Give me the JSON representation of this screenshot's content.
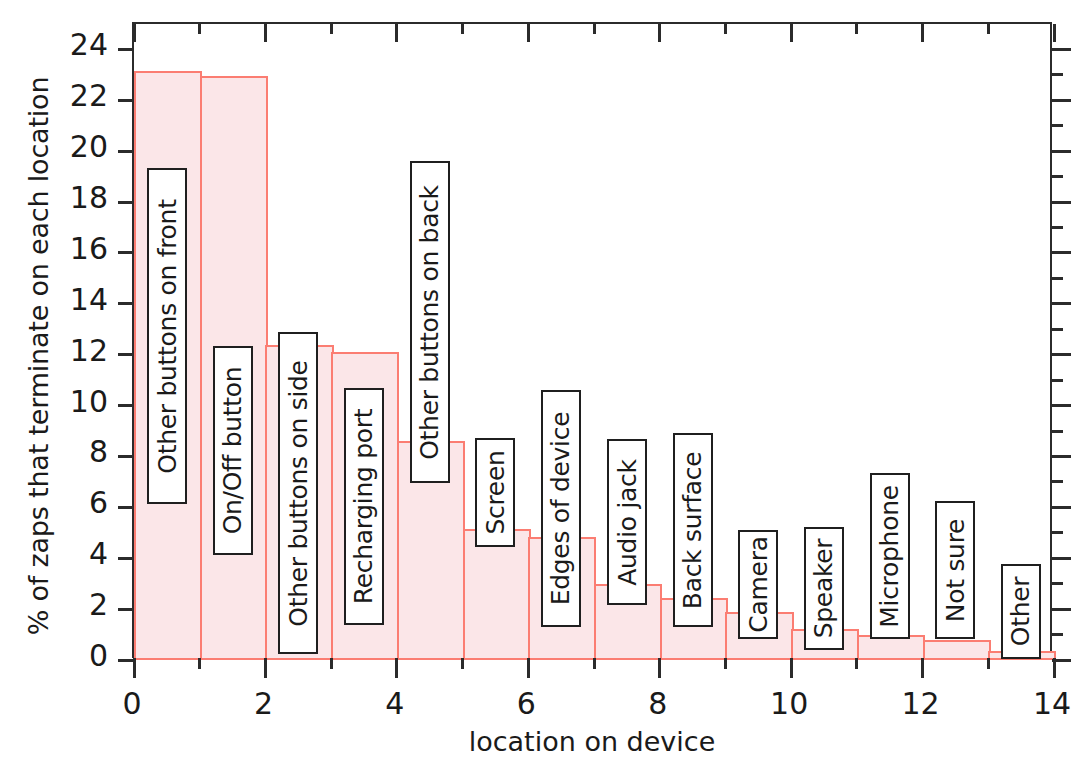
{
  "chart_data": {
    "type": "bar",
    "title": "",
    "xlabel": "location on device",
    "ylabel": "% of zaps that terminate on each location",
    "xlim": [
      0,
      14
    ],
    "ylim": [
      0,
      25
    ],
    "grid": false,
    "legend": "none",
    "x_tick_labels": [
      "0",
      "2",
      "4",
      "6",
      "8",
      "10",
      "12",
      "14"
    ],
    "x_tick_values": [
      0,
      2,
      4,
      6,
      8,
      10,
      12,
      14
    ],
    "y_tick_labels": [
      "0",
      "2",
      "4",
      "6",
      "8",
      "10",
      "12",
      "14",
      "16",
      "18",
      "20",
      "22",
      "24"
    ],
    "y_tick_values": [
      0,
      2,
      4,
      6,
      8,
      10,
      12,
      14,
      16,
      18,
      20,
      22,
      24
    ],
    "categories": [
      "Other buttons on front",
      "On/Off button",
      "Other buttons on side",
      "Recharging port",
      "Other buttons on back",
      "Screen",
      "Edges of device",
      "Audio jack",
      "Back surface",
      "Camera",
      "Speaker",
      "Microphone",
      "Not sure",
      "Other"
    ],
    "values": [
      23.15,
      22.95,
      12.4,
      12.1,
      8.6,
      5.15,
      4.85,
      3.0,
      2.45,
      1.9,
      1.2,
      1.0,
      0.8,
      0.35
    ],
    "bar_fill_color": "#fbe6e8",
    "bar_edge_color": "#fb7d72",
    "label_box_border_color": "#1f1f1f",
    "axis_color": "#2b2b2b"
  }
}
